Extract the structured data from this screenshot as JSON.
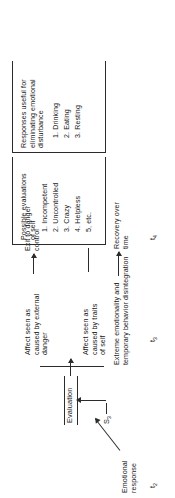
{
  "figure": {
    "orientation": "rotated-90-ccw",
    "colors": {
      "ink": "#202020",
      "rule": "#2b2b2b",
      "background": "#ffffff"
    }
  },
  "nodes": {
    "emotional_response": "Emotional\nresponse",
    "stimulus": "S",
    "stimulus_subscript": "3",
    "evaluation": "Evaluation",
    "extreme": "Extreme emotionality and\ntemporary behavior disintegration",
    "recovery": "Recovery over\ntime",
    "affect_external": "Affect seen as\ncaused by external\ndanger",
    "affect_traits": "Affect seen as\ncaused by traits\nof self",
    "exit_danger": "Exit to danger\ncontrol"
  },
  "columns": {
    "evaluations": {
      "heading": "Possible evaluations\nof self",
      "items": [
        "1. Incompetent",
        "2. Uncontrolled",
        "3. Crazy",
        "4. Helpless",
        "5, etc."
      ]
    },
    "responses": {
      "heading": "Responses useful for\neliminating emotional\ndisturbance",
      "items": [
        "1. Drinking",
        "2. Eating",
        "3. Resting"
      ]
    }
  },
  "time_markers": [
    {
      "label": "t",
      "subscript": "2"
    },
    {
      "label": "t",
      "subscript": "3"
    },
    {
      "label": "t",
      "subscript": "4"
    }
  ]
}
